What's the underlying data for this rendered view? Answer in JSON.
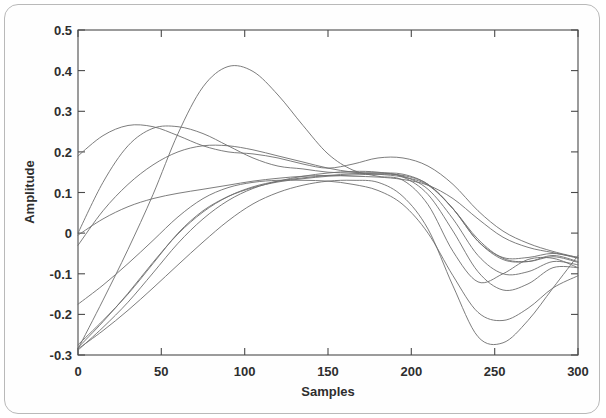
{
  "figure": {
    "border_color": "#b9b9b9",
    "background": "#ffffff"
  },
  "chart_data": {
    "type": "line",
    "title": "",
    "subtitle": "",
    "xlabel": "Samples",
    "ylabel": "Amplitude",
    "xlim": [
      0,
      300
    ],
    "ylim": [
      -0.3,
      0.5
    ],
    "xticks": [
      0,
      50,
      100,
      150,
      200,
      250,
      300
    ],
    "xticklabels": [
      "0",
      "50",
      "100",
      "150",
      "200",
      "250",
      "300"
    ],
    "yticks": [
      -0.3,
      -0.2,
      -0.1,
      0,
      0.1,
      0.2,
      0.3,
      0.4,
      0.5
    ],
    "yticklabels": [
      "-0.3",
      "-0.2",
      "-0.1",
      "0",
      "0.1",
      "0.2",
      "0.3",
      "0.4",
      "0.5"
    ],
    "grid": false,
    "legend": null,
    "legend_position": "none",
    "line_color": "#6e6e6e",
    "line_width": 0.9,
    "n_series": 10,
    "x": [
      0,
      15,
      30,
      45,
      60,
      75,
      90,
      105,
      120,
      135,
      150,
      165,
      180,
      195,
      210,
      225,
      240,
      255,
      270,
      285,
      300
    ],
    "series": [
      {
        "name": "curve-1",
        "values": [
          -0.285,
          -0.165,
          -0.04,
          0.095,
          0.245,
          0.36,
          0.41,
          0.398,
          0.34,
          0.265,
          0.195,
          0.155,
          0.14,
          0.13,
          0.07,
          -0.045,
          -0.12,
          -0.1,
          -0.065,
          -0.062,
          -0.085
        ]
      },
      {
        "name": "curve-2",
        "values": [
          0.19,
          0.24,
          0.265,
          0.262,
          0.24,
          0.215,
          0.2,
          0.195,
          0.185,
          0.17,
          0.16,
          0.17,
          0.185,
          0.185,
          0.165,
          0.12,
          0.055,
          0.005,
          -0.025,
          -0.045,
          -0.06
        ]
      },
      {
        "name": "curve-3",
        "values": [
          0.0,
          0.125,
          0.215,
          0.258,
          0.262,
          0.245,
          0.215,
          0.185,
          0.165,
          0.158,
          0.15,
          0.148,
          0.148,
          0.145,
          0.12,
          0.06,
          -0.02,
          -0.06,
          -0.06,
          -0.05,
          -0.062
        ]
      },
      {
        "name": "curve-4",
        "values": [
          -0.03,
          0.055,
          0.12,
          0.168,
          0.2,
          0.215,
          0.215,
          0.205,
          0.19,
          0.175,
          0.16,
          0.15,
          0.145,
          0.138,
          0.118,
          0.06,
          -0.015,
          -0.062,
          -0.07,
          -0.058,
          -0.072
        ]
      },
      {
        "name": "curve-5",
        "values": [
          -0.005,
          0.035,
          0.065,
          0.085,
          0.098,
          0.108,
          0.118,
          0.128,
          0.135,
          0.14,
          0.142,
          0.14,
          0.138,
          0.132,
          0.118,
          0.085,
          0.035,
          -0.01,
          -0.035,
          -0.048,
          -0.06
        ]
      },
      {
        "name": "curve-6",
        "values": [
          -0.275,
          -0.215,
          -0.15,
          -0.075,
          0.0,
          0.055,
          0.09,
          0.112,
          0.126,
          0.134,
          0.14,
          0.143,
          0.145,
          0.142,
          0.12,
          0.06,
          -0.02,
          -0.065,
          -0.07,
          -0.055,
          -0.07
        ]
      },
      {
        "name": "curve-7",
        "values": [
          -0.282,
          -0.218,
          -0.148,
          -0.072,
          -0.002,
          0.052,
          0.09,
          0.114,
          0.128,
          0.136,
          0.142,
          0.146,
          0.148,
          0.14,
          0.108,
          0.035,
          -0.055,
          -0.1,
          -0.095,
          -0.07,
          -0.078
        ]
      },
      {
        "name": "curve-8",
        "values": [
          -0.288,
          -0.232,
          -0.17,
          -0.098,
          -0.025,
          0.035,
          0.08,
          0.11,
          0.128,
          0.14,
          0.148,
          0.152,
          0.15,
          0.138,
          0.095,
          0.005,
          -0.095,
          -0.14,
          -0.125,
          -0.085,
          -0.085
        ]
      },
      {
        "name": "curve-9",
        "values": [
          -0.175,
          -0.128,
          -0.075,
          -0.018,
          0.04,
          0.085,
          0.112,
          0.125,
          0.13,
          0.13,
          0.128,
          0.12,
          0.105,
          0.07,
          0.0,
          -0.105,
          -0.195,
          -0.215,
          -0.185,
          -0.135,
          -0.105
        ]
      },
      {
        "name": "curve-10",
        "values": [
          -0.285,
          -0.24,
          -0.19,
          -0.135,
          -0.078,
          -0.022,
          0.03,
          0.072,
          0.1,
          0.118,
          0.128,
          0.13,
          0.125,
          0.09,
          0.01,
          -0.13,
          -0.255,
          -0.27,
          -0.215,
          -0.135,
          -0.055
        ]
      }
    ],
    "annotations": [
      {
        "text": "global maximum",
        "x": 62,
        "y": 0.41
      },
      {
        "text": "global minimum",
        "x": 232,
        "y": -0.272
      }
    ]
  },
  "caption": {
    "text": "",
    "visible": false
  }
}
